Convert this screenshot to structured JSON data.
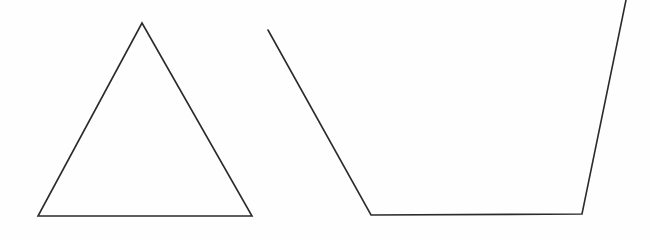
{
  "canvas": {
    "width": 650,
    "height": 241,
    "background_color": "#fefefe",
    "stroke_color": "#2b2b2b",
    "stroke_width": 1.6
  },
  "figures": [
    {
      "name": "triangle",
      "label": "Isosceles triangle",
      "closed": true,
      "vertices": [
        [
          142,
          23
        ],
        [
          252,
          216
        ],
        [
          38,
          216
        ]
      ],
      "vertex_labels": [
        "apex",
        "bottom-right",
        "bottom-left"
      ],
      "path": "M 142 23 L 252 216 L 38 216 Z"
    },
    {
      "name": "open-trapezoid",
      "label": "Open trapezoid",
      "closed": false,
      "vertices": [
        [
          268,
          30
        ],
        [
          371,
          215
        ],
        [
          582,
          214
        ],
        [
          626,
          0
        ]
      ],
      "vertex_labels": [
        "top-left-endpoint",
        "bottom-left",
        "bottom-right",
        "top-right-endpoint"
      ],
      "path": "M 268 30 L 371 215 L 582 214 L 626 0"
    }
  ]
}
